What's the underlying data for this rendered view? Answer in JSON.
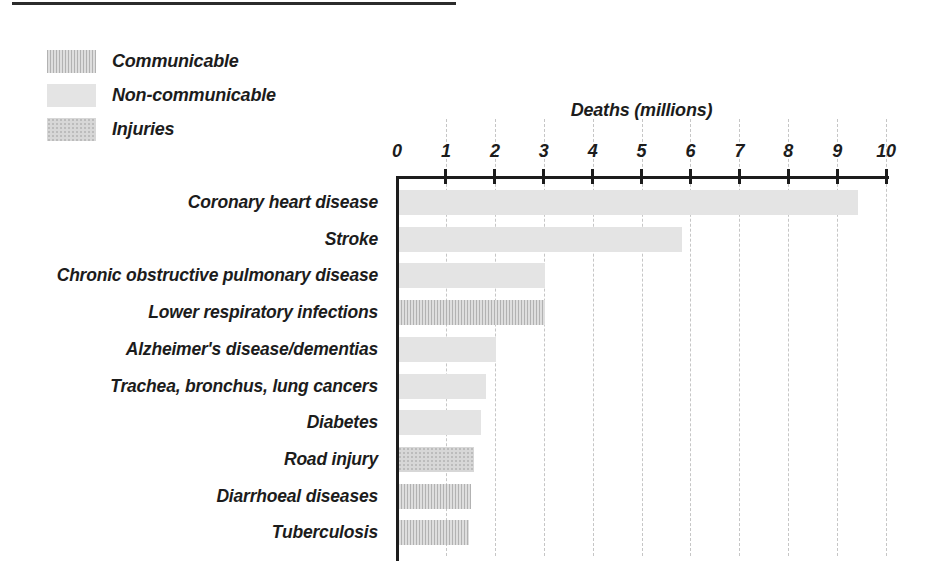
{
  "legend": {
    "items": [
      {
        "label": "Communicable",
        "key": "communicable"
      },
      {
        "label": "Non-communicable",
        "key": "noncommunicable"
      },
      {
        "label": "Injuries",
        "key": "injuries"
      }
    ]
  },
  "axis": {
    "title": "Deaths (millions)"
  },
  "chart_data": {
    "type": "bar",
    "orientation": "horizontal",
    "title": "",
    "xlabel": "Deaths (millions)",
    "ylabel": "",
    "xlim": [
      0,
      10
    ],
    "x_ticks": [
      0,
      1,
      2,
      3,
      4,
      5,
      6,
      7,
      8,
      9,
      10
    ],
    "grid": true,
    "legend_position": "top-left",
    "categories": [
      "Coronary heart disease",
      "Stroke",
      "Chronic obstructive pulmonary disease",
      "Lower respiratory infections",
      "Alzheimer's disease/dementias",
      "Trachea, bronchus, lung cancers",
      "Diabetes",
      "Road injury",
      "Diarrhoeal diseases",
      "Tuberculosis"
    ],
    "values": [
      9.4,
      5.8,
      3.0,
      3.0,
      2.0,
      1.8,
      1.7,
      1.55,
      1.5,
      1.45
    ],
    "groups": [
      "noncommunicable",
      "noncommunicable",
      "noncommunicable",
      "communicable",
      "noncommunicable",
      "noncommunicable",
      "noncommunicable",
      "injuries",
      "communicable",
      "communicable"
    ]
  },
  "colors": {
    "text": "#1c1c1c",
    "axis": "#1c1c1c",
    "gridline": "#c6c6c6",
    "noncommunicable": "#e4e4e4",
    "communicable_stripe": "#b2b2b2",
    "communicable_bg": "#dedede",
    "injuries_bg": "#d7d7d7",
    "injuries_dot": "#bcbcbc"
  }
}
